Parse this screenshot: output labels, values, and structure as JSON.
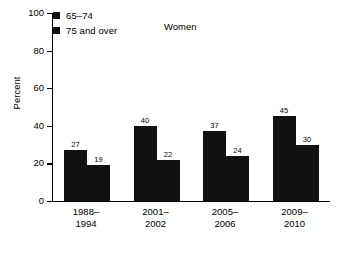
{
  "chart_data": {
    "type": "bar",
    "title": "",
    "subtitle": "",
    "annotation": "Women",
    "xlabel": "",
    "ylabel": "Percent",
    "ylim": [
      0,
      100
    ],
    "yticks": [
      0,
      20,
      40,
      60,
      80,
      100
    ],
    "grid": false,
    "legend_position": "top-left",
    "categories": [
      "1988–\n1994",
      "2001–\n2002",
      "2005–\n2006",
      "2009–\n2010"
    ],
    "category_lines": [
      [
        "1988–",
        "1994"
      ],
      [
        "2001–",
        "2002"
      ],
      [
        "2005–",
        "2006"
      ],
      [
        "2009–",
        "2010"
      ]
    ],
    "series": [
      {
        "name": "65–74",
        "color": "#111111",
        "values": [
          27,
          40,
          37,
          45
        ]
      },
      {
        "name": "75 and over",
        "color": "#111111",
        "values": [
          19,
          22,
          24,
          30
        ]
      }
    ]
  },
  "legend": {
    "items": [
      {
        "label": "65–74"
      },
      {
        "label": "75 and over"
      }
    ]
  },
  "axes": {
    "y_title": "Percent",
    "y_tick_labels": [
      "100",
      "80",
      "60",
      "40",
      "20",
      "0"
    ]
  },
  "colors": {
    "bar": "#111111",
    "axis": "#000000",
    "background": "#ffffff"
  }
}
